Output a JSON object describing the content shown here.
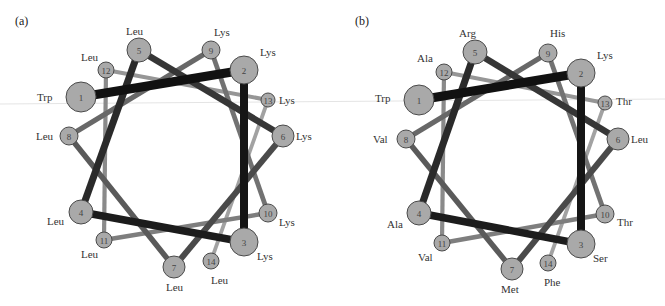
{
  "figure": {
    "node_fill": "#a9a9a9",
    "node_stroke": "#4a4a4a",
    "connector_colors": [
      "#111111",
      "#151515",
      "#1c1c1c",
      "#2a2a2a",
      "#363636",
      "#4a4a4a",
      "#5a5a5a",
      "#686868",
      "#727272",
      "#7e7e7e",
      "#8a8a8a",
      "#969696",
      "#a2a2a2"
    ],
    "connector_widths": [
      9,
      8,
      7.5,
      7,
      6.5,
      6,
      5.5,
      5,
      4.8,
      4.5,
      4.2,
      4,
      3.8
    ]
  },
  "panels": [
    {
      "label": "(a)",
      "residues": [
        {
          "n": "1",
          "name": "Trp",
          "x": 81,
          "y": 97,
          "r": 15,
          "lx": -44,
          "ly": 4
        },
        {
          "n": "2",
          "name": "Lys",
          "x": 244,
          "y": 70,
          "r": 14,
          "lx": 16,
          "ly": -14
        },
        {
          "n": "3",
          "name": "Lys",
          "x": 244,
          "y": 242,
          "r": 14,
          "lx": 13,
          "ly": 18
        },
        {
          "n": "4",
          "name": "Leu",
          "x": 81,
          "y": 212,
          "r": 12,
          "lx": -34,
          "ly": 13
        },
        {
          "n": "5",
          "name": "Leu",
          "x": 139,
          "y": 50,
          "r": 12,
          "lx": -13,
          "ly": -15
        },
        {
          "n": "6",
          "name": "Lys",
          "x": 283,
          "y": 136,
          "r": 11,
          "lx": 13,
          "ly": 4
        },
        {
          "n": "7",
          "name": "Leu",
          "x": 174,
          "y": 267,
          "r": 11,
          "lx": -8,
          "ly": 24
        },
        {
          "n": "8",
          "name": "Leu",
          "x": 69,
          "y": 136,
          "r": 9,
          "lx": -33,
          "ly": 4
        },
        {
          "n": "9",
          "name": "Lys",
          "x": 211,
          "y": 50,
          "r": 9,
          "lx": 3,
          "ly": -14
        },
        {
          "n": "10",
          "name": "Lys",
          "x": 268,
          "y": 213,
          "r": 9,
          "lx": 11,
          "ly": 13
        },
        {
          "n": "11",
          "name": "Leu",
          "x": 104,
          "y": 240,
          "r": 8,
          "lx": -23,
          "ly": 18
        },
        {
          "n": "12",
          "name": "Leu",
          "x": 106,
          "y": 70,
          "r": 8,
          "lx": -25,
          "ly": -9
        },
        {
          "n": "13",
          "name": "Lys",
          "x": 268,
          "y": 100,
          "r": 7,
          "lx": 11,
          "ly": 4
        },
        {
          "n": "14",
          "name": "Leu",
          "x": 211,
          "y": 261,
          "r": 8,
          "lx": 0,
          "ly": 23
        }
      ]
    },
    {
      "label": "(b)",
      "residues": [
        {
          "n": "1",
          "name": "Trp",
          "x": 419,
          "y": 100,
          "r": 15,
          "lx": -44,
          "ly": 2
        },
        {
          "n": "2",
          "name": "Lys",
          "x": 581,
          "y": 73,
          "r": 14,
          "lx": 16,
          "ly": -14
        },
        {
          "n": "3",
          "name": "Ser",
          "x": 581,
          "y": 244,
          "r": 14,
          "lx": 12,
          "ly": 18
        },
        {
          "n": "4",
          "name": "Ala",
          "x": 419,
          "y": 213,
          "r": 12,
          "lx": -32,
          "ly": 15
        },
        {
          "n": "5",
          "name": "Arg",
          "x": 475,
          "y": 52,
          "r": 12,
          "lx": -16,
          "ly": -15
        },
        {
          "n": "6",
          "name": "Leu",
          "x": 618,
          "y": 139,
          "r": 11,
          "lx": 13,
          "ly": 4
        },
        {
          "n": "7",
          "name": "Met",
          "x": 512,
          "y": 269,
          "r": 11,
          "lx": -11,
          "ly": 24
        },
        {
          "n": "8",
          "name": "Val",
          "x": 406,
          "y": 139,
          "r": 9,
          "lx": -33,
          "ly": 4
        },
        {
          "n": "9",
          "name": "His",
          "x": 548,
          "y": 53,
          "r": 9,
          "lx": 2,
          "ly": -16
        },
        {
          "n": "10",
          "name": "Thr",
          "x": 605,
          "y": 214,
          "r": 9,
          "lx": 12,
          "ly": 12
        },
        {
          "n": "11",
          "name": "Val",
          "x": 442,
          "y": 243,
          "r": 8,
          "lx": -24,
          "ly": 18
        },
        {
          "n": "12",
          "name": "Ala",
          "x": 444,
          "y": 72,
          "r": 8,
          "lx": -27,
          "ly": -10
        },
        {
          "n": "13",
          "name": "Thr",
          "x": 605,
          "y": 103,
          "r": 7,
          "lx": 11,
          "ly": 2
        },
        {
          "n": "14",
          "name": "Phe",
          "x": 548,
          "y": 263,
          "r": 8,
          "lx": -4,
          "ly": 23
        }
      ]
    }
  ]
}
